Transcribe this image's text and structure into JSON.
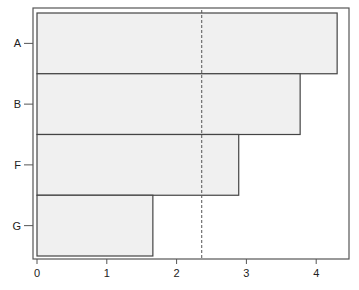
{
  "chart_data": {
    "type": "bar",
    "orientation": "horizontal",
    "title": "",
    "xlabel": "",
    "ylabel": "",
    "categories": [
      "A",
      "B",
      "F",
      "G"
    ],
    "values": [
      4.3,
      3.77,
      2.89,
      1.66
    ],
    "xlim": [
      0,
      4.4
    ],
    "xticks": [
      0,
      1,
      2,
      3,
      4
    ],
    "reference_line": {
      "x": 2.36,
      "style": "dashed"
    },
    "grid": false,
    "legend": null
  },
  "colors": {
    "bar_fill": "#f0f0f0",
    "bar_stroke": "#444444",
    "frame": "#555555",
    "reference_line": "#555555"
  }
}
